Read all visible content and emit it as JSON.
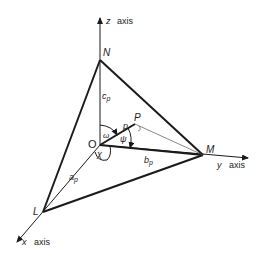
{
  "diagram": {
    "axes": {
      "z": {
        "name": "z",
        "label": "axis"
      },
      "y": {
        "name": "y",
        "label": "axis"
      },
      "x": {
        "name": "x",
        "label": "axis"
      }
    },
    "points": {
      "origin": "O",
      "N": "N",
      "M": "M",
      "L": "L",
      "P": "P"
    },
    "segments": {
      "c": "c",
      "c_sub": "p",
      "b": "b",
      "b_sub": "p",
      "a": "a",
      "a_sub": "p",
      "p": "p"
    },
    "angles": {
      "omega": "ω",
      "psi": "ψ",
      "chi": "χ"
    },
    "colors": {
      "line": "#1a1a1a",
      "background": "#ffffff"
    }
  }
}
